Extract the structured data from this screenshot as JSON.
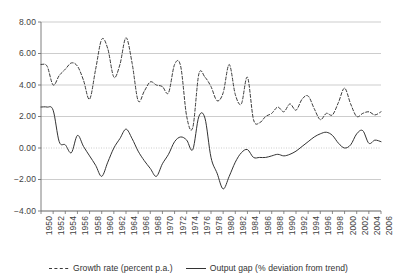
{
  "chart_data": {
    "type": "line",
    "title": "",
    "subtitle": "",
    "xlabel": "",
    "ylabel": "",
    "xlim": [
      1950,
      2006
    ],
    "ylim": [
      -4.0,
      8.0
    ],
    "grid": true,
    "legend_position": "bottom",
    "y_ticks": [
      "8.00",
      "6.00",
      "4.00",
      "2.00",
      "0.00",
      "-2.00",
      "-4.00"
    ],
    "y_tick_values": [
      8,
      6,
      4,
      2,
      0,
      -2,
      -4
    ],
    "x_ticks": [
      "1950",
      "1952",
      "1954",
      "1956",
      "1958",
      "1960",
      "1962",
      "1964",
      "1966",
      "1968",
      "1970",
      "1972",
      "1974",
      "1976",
      "1978",
      "1980",
      "1982",
      "1984",
      "1986",
      "1988",
      "1990",
      "1992",
      "1994",
      "1996",
      "1998",
      "2000",
      "2002",
      "2004",
      "2006"
    ],
    "x_tick_values": [
      1950,
      1952,
      1954,
      1956,
      1958,
      1960,
      1962,
      1964,
      1966,
      1968,
      1970,
      1972,
      1974,
      1976,
      1978,
      1980,
      1982,
      1984,
      1986,
      1988,
      1990,
      1992,
      1994,
      1996,
      1998,
      2000,
      2002,
      2004,
      2006
    ],
    "x": [
      1950,
      1951,
      1952,
      1953,
      1954,
      1955,
      1956,
      1957,
      1958,
      1959,
      1960,
      1961,
      1962,
      1963,
      1964,
      1965,
      1966,
      1967,
      1968,
      1969,
      1970,
      1971,
      1972,
      1973,
      1974,
      1975,
      1976,
      1977,
      1978,
      1979,
      1980,
      1981,
      1982,
      1983,
      1984,
      1985,
      1986,
      1987,
      1988,
      1989,
      1990,
      1991,
      1992,
      1993,
      1994,
      1995,
      1996,
      1997,
      1998,
      1999,
      2000,
      2001,
      2002,
      2003,
      2004,
      2005,
      2006
    ],
    "series": [
      {
        "name": "Growth rate (percent p.a.)",
        "style": "dashed",
        "color": "#3a3a3a",
        "values": [
          5.3,
          5.2,
          4.0,
          4.6,
          5.0,
          5.4,
          5.2,
          4.3,
          3.1,
          5.0,
          6.9,
          6.3,
          4.5,
          5.3,
          7.0,
          5.4,
          3.0,
          3.6,
          4.2,
          4.0,
          3.9,
          3.5,
          5.3,
          5.2,
          2.0,
          1.3,
          4.7,
          4.5,
          3.9,
          3.0,
          3.5,
          5.3,
          3.4,
          2.8,
          4.5,
          1.8,
          1.6,
          2.0,
          2.2,
          2.6,
          2.3,
          2.8,
          2.4,
          3.1,
          3.3,
          2.5,
          1.8,
          2.2,
          2.1,
          2.9,
          3.8,
          2.8,
          2.0,
          2.2,
          2.3,
          2.1,
          2.3
        ]
      },
      {
        "name": "Output gap (% deviation from trend)",
        "style": "solid",
        "color": "#333333",
        "values": [
          2.6,
          2.6,
          2.4,
          0.4,
          0.2,
          -0.3,
          0.8,
          0.1,
          -0.5,
          -1.1,
          -1.8,
          -0.9,
          0.0,
          0.6,
          1.2,
          0.6,
          -0.2,
          -0.8,
          -1.3,
          -1.8,
          -1.0,
          -0.4,
          0.4,
          0.7,
          0.5,
          -0.1,
          2.0,
          1.9,
          -0.6,
          -1.6,
          -2.6,
          -1.8,
          -0.9,
          -0.3,
          -0.1,
          -0.6,
          -0.6,
          -0.6,
          -0.5,
          -0.4,
          -0.5,
          -0.4,
          -0.2,
          0.1,
          0.4,
          0.7,
          0.9,
          1.0,
          0.8,
          0.3,
          0.0,
          0.2,
          0.9,
          1.1,
          0.3,
          0.5,
          0.4
        ]
      }
    ],
    "annotations": []
  },
  "legend": {
    "entries": [
      {
        "marker": "dashed-line-swatch",
        "label": "Growth rate (percent p.a.)"
      },
      {
        "marker": "solid-line-swatch",
        "label": "Output gap (% deviation from trend)"
      }
    ]
  },
  "colors": {
    "grid": "#b8b8b8",
    "axis": "#6f6f6f",
    "zero_line": "#c0c0c0",
    "growth_rate": "#3a3a3a",
    "output_gap": "#333333",
    "background": "#ffffff",
    "text": "#3f3f3f"
  }
}
